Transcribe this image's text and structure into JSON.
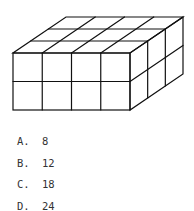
{
  "figure": {
    "front_columns": 4,
    "depth_rows": 3,
    "height_layers": 2,
    "stroke_color": "#111111"
  },
  "options": [
    {
      "label": "A.",
      "value": "8"
    },
    {
      "label": "B.",
      "value": "12"
    },
    {
      "label": "C.",
      "value": "18"
    },
    {
      "label": "D.",
      "value": "24"
    }
  ]
}
